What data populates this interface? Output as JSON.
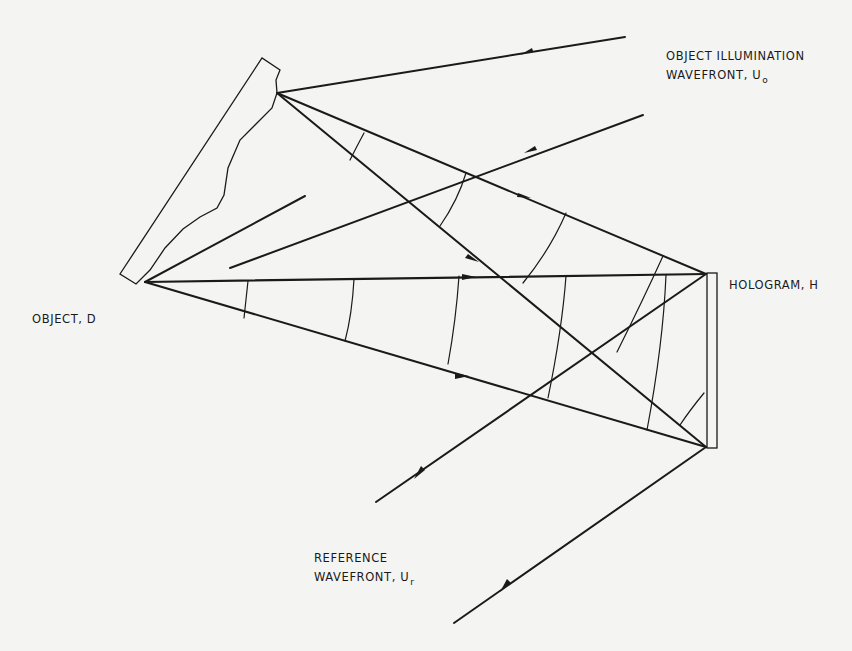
{
  "diagram": {
    "colors": {
      "background": "#f4f4f2",
      "ink": "#1a1a1a"
    },
    "labels": {
      "object_illumination": {
        "line1": "OBJECT ILLUMINATION",
        "line2": "WAVEFRONT, U",
        "subscript": "o"
      },
      "hologram": {
        "text": "HOLOGRAM, H"
      },
      "object": {
        "text": "OBJECT, D"
      },
      "reference": {
        "line1": "REFERENCE",
        "line2": "WAVEFRONT, U",
        "subscript": "r"
      }
    },
    "elements": [
      "object-outline",
      "hologram-plate",
      "illumination-rays",
      "object-rays",
      "reference-rays",
      "wavefront-arcs"
    ]
  }
}
